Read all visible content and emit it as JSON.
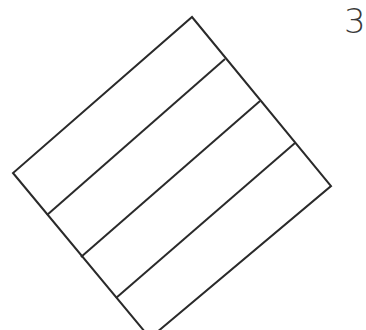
{
  "figure": {
    "label": "3",
    "stroke_color": "#2a2a2a",
    "stroke_width": 2,
    "background": "#ffffff",
    "outer_square": {
      "top": [
        192,
        17
      ],
      "right": [
        331,
        186
      ],
      "bottom": [
        150,
        338
      ],
      "left": [
        13,
        173
      ]
    },
    "divider_lines": [
      {
        "from": [
          225,
          59
        ],
        "to": [
          47,
          215
        ]
      },
      {
        "from": [
          260,
          101
        ],
        "to": [
          81,
          257
        ]
      },
      {
        "from": [
          295,
          143
        ],
        "to": [
          116,
          298
        ]
      }
    ],
    "strip_count": 4
  }
}
